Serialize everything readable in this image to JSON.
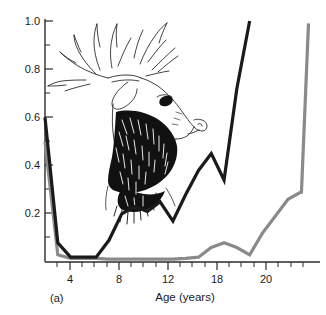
{
  "figure": {
    "panel_label": "(a)",
    "background_color": "#ffffff"
  },
  "axes": {
    "x_title": "Age (years)",
    "y_title": "",
    "x_tick_labels": [
      "4",
      "8",
      "12",
      "18",
      "20"
    ],
    "y_tick_labels": [
      "0.2",
      "0.4",
      "0.6",
      "0.8",
      "1.0"
    ],
    "x_label_4": "4",
    "x_label_8": "8",
    "x_label_12": "12",
    "x_label_18": "18",
    "x_label_20": "20",
    "y_label_02": "0.2",
    "y_label_04": "0.4",
    "y_label_06": "0.6",
    "y_label_08": "0.8",
    "y_label_10": "1.0"
  },
  "illustration": {
    "name": "elk-stag-head",
    "description": "Line-art engraving of a bull elk head with large branching antlers",
    "ink_color": "#111111"
  },
  "colors": {
    "series_dark": "#1a1a1a",
    "series_gray": "#8a8a8a",
    "axis": "#2b2b2b"
  },
  "chart_data": {
    "type": "line",
    "title": "",
    "xlabel": "Age (years)",
    "ylabel": "",
    "xlim": [
      0,
      21.5
    ],
    "ylim": [
      0,
      1.0
    ],
    "grid": false,
    "legend": "none",
    "x_ticks_major": [
      4,
      8,
      12,
      16,
      20
    ],
    "x_tick_labels_shown": [
      "4",
      "8",
      "12",
      "18",
      "20"
    ],
    "y_ticks_major": [
      0.2,
      0.4,
      0.6,
      0.8,
      1.0
    ],
    "y_ticks_minor": [
      0.1,
      0.3,
      0.5,
      0.7,
      0.9
    ],
    "series": [
      {
        "name": "dark-curve",
        "color": "#1a1a1a",
        "x": [
          0,
          1,
          2,
          3,
          4,
          5,
          6,
          7,
          8,
          9,
          10,
          11,
          12,
          13,
          14,
          15,
          16
        ],
        "values": [
          0.6,
          0.08,
          0.02,
          0.02,
          0.02,
          0.09,
          0.2,
          0.23,
          0.21,
          0.25,
          0.17,
          0.28,
          0.38,
          0.45,
          0.34,
          0.72,
          1.0
        ]
      },
      {
        "name": "gray-curve",
        "color": "#8a8a8a",
        "x": [
          0,
          1,
          2,
          3,
          4,
          5,
          6,
          7,
          8,
          9,
          10,
          11,
          12,
          13,
          14,
          15,
          16,
          17,
          18,
          19,
          20,
          20.05,
          20.6
        ],
        "values": [
          0.5,
          0.03,
          0.015,
          0.015,
          0.015,
          0.012,
          0.012,
          0.012,
          0.012,
          0.012,
          0.012,
          0.015,
          0.02,
          0.06,
          0.08,
          0.06,
          0.03,
          0.12,
          0.19,
          0.26,
          0.29,
          0.29,
          0.99
        ]
      }
    ]
  }
}
